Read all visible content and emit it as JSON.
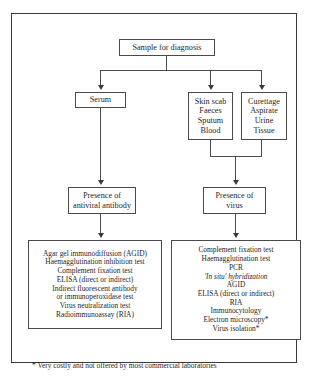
{
  "figure": {
    "title_node": {
      "label": "Sample for diagnosis"
    },
    "sample_nodes": [
      {
        "name": "serum",
        "lines": [
          "Serum"
        ]
      },
      {
        "name": "skin-scab",
        "lines": [
          "Skin scab",
          "Faeces",
          "Sputum",
          "Blood"
        ]
      },
      {
        "name": "curettage",
        "lines": [
          "Curettage",
          "Aspirate",
          "Urine",
          "Tissue"
        ]
      }
    ],
    "intermediate_nodes": [
      {
        "name": "presence-of-antiviral-antibody",
        "lines": [
          "Presence of",
          "antiviral antibody"
        ]
      },
      {
        "name": "presence-of-virus",
        "lines": [
          "Presence of",
          "virus"
        ]
      }
    ],
    "test_nodes": [
      {
        "name": "serology-tests",
        "lines": [
          "Agar gel immunodiffusion (AGID)",
          "Haemagglutination inhibition test",
          "Complement fixation test",
          "ELISA (direct or indirect)",
          "Indirect fluorescent antibody",
          "or immunoperoxidase test",
          "Virus neutralization test",
          "Radioimmunoassay (RIA)"
        ]
      },
      {
        "name": "virology-tests",
        "lines": [
          "Complement fixation test",
          "Haemagglutination test",
          "PCR",
          "'In situ' hybridization",
          "AGID",
          "ELISA (direct or indirect)",
          "RIA",
          "Immunocytology",
          "Electron microscopy*",
          "Virus isolation*"
        ]
      }
    ],
    "footnote": "* Very costly and not offered by most commercial laboratories",
    "colors": {
      "frame_border": "#3a3a3a",
      "box_border": "#4a4a4a",
      "text": "#1f1f1f",
      "background": "#ffffff"
    }
  }
}
